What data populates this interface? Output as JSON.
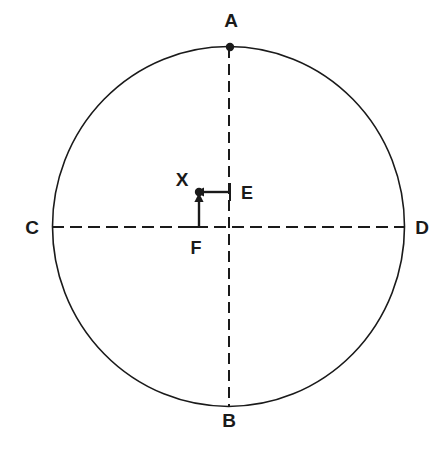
{
  "diagram": {
    "kind": "geometry-circle-diagram",
    "background_color": "#ffffff",
    "stroke_color": "#1a1a1a",
    "canvas": {
      "width": 443,
      "height": 470
    },
    "circle": {
      "name": "main-circle",
      "center_x": 228.5,
      "center_y": 226.5,
      "radius_x": 176,
      "radius_y": 180,
      "stroke_width": 1.6,
      "fill": "none"
    },
    "axes": [
      {
        "name": "vertical-diameter",
        "orientation": "vertical",
        "from_label": "A",
        "to_label": "B",
        "x1": 229,
        "y1": 47,
        "x2": 229,
        "y2": 406,
        "dash": "11 6"
      },
      {
        "name": "horizontal-diameter",
        "orientation": "horizontal",
        "from_label": "C",
        "to_label": "D",
        "x1": 52,
        "y1": 227,
        "x2": 405,
        "y2": 227,
        "dash": "12 6"
      }
    ],
    "points": [
      {
        "id": "A",
        "label": "A",
        "x": 230,
        "y": 47,
        "dot": true,
        "label_x": 231,
        "label_y": 27,
        "label_anchor": "middle"
      },
      {
        "id": "B",
        "label": "B",
        "x": 229,
        "y": 406,
        "dot": false,
        "label_x": 229,
        "label_y": 427,
        "label_anchor": "middle"
      },
      {
        "id": "C",
        "label": "C",
        "x": 52,
        "y": 227,
        "dot": false,
        "label_x": 32,
        "label_y": 234,
        "label_anchor": "middle"
      },
      {
        "id": "D",
        "label": "D",
        "x": 405,
        "y": 227,
        "dot": false,
        "label_x": 422,
        "label_y": 234,
        "label_anchor": "middle"
      },
      {
        "id": "X",
        "label": "X",
        "x": 199,
        "y": 192,
        "dot": true,
        "label_x": 182,
        "label_y": 186,
        "label_anchor": "middle"
      }
    ],
    "arrows": [
      {
        "id": "E",
        "label": "E",
        "name": "arrow-e-horizontal",
        "direction": "left",
        "tail_x": 230,
        "tail_y": 192,
        "head_x": 204,
        "head_y": 192,
        "tick": {
          "x1": 230,
          "y1": 183,
          "x2": 230,
          "y2": 201
        },
        "label_x": 241,
        "label_y": 199,
        "label_anchor": "start"
      },
      {
        "id": "F",
        "label": "F",
        "name": "arrow-f-vertical",
        "direction": "up",
        "tail_x": 199,
        "tail_y": 227,
        "head_x": 199,
        "head_y": 202,
        "tick": {
          "x1": 190,
          "y1": 227,
          "x2": 208,
          "y2": 227
        },
        "label_x": 196,
        "label_y": 254,
        "label_anchor": "middle"
      }
    ]
  }
}
